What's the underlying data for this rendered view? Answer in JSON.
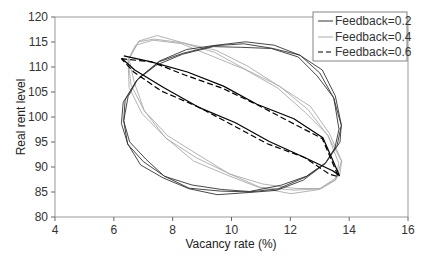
{
  "chart_data": {
    "type": "line",
    "title": "",
    "xlabel": "Vacancy rate (%)",
    "ylabel": "Real rent level",
    "xlim": [
      4,
      16
    ],
    "ylim": [
      80,
      120
    ],
    "xticks": [
      4,
      6,
      8,
      10,
      12,
      14,
      16
    ],
    "yticks": [
      80,
      85,
      90,
      95,
      100,
      105,
      110,
      115,
      120
    ],
    "grid": false,
    "legend_position": "upper right",
    "series": [
      {
        "name": "Feedback=0.2",
        "color": "#333333",
        "style": "solid",
        "shape": "closed loop (limit cycle)",
        "x": [
          13.7,
          13.5,
          13.0,
          12.3,
          11.4,
          10.4,
          9.4,
          8.4,
          7.5,
          6.8,
          6.4,
          6.3,
          6.5,
          7.0,
          7.7,
          8.6,
          9.6,
          10.6,
          11.6,
          12.5,
          13.2,
          13.6,
          13.7
        ],
        "y": [
          98.0,
          104.0,
          108.8,
          112.2,
          114.0,
          114.5,
          114.2,
          113.0,
          110.8,
          107.5,
          103.5,
          99.0,
          94.8,
          91.0,
          88.0,
          86.0,
          85.0,
          85.0,
          85.8,
          87.8,
          90.8,
          94.4,
          98.0
        ]
      },
      {
        "name": "Feedback=0.4",
        "color": "#aaaaaa",
        "style": "solid",
        "shape": "closed loop (limit cycle)",
        "x": [
          13.7,
          13.3,
          12.6,
          11.6,
          10.5,
          9.4,
          8.3,
          7.4,
          6.8,
          6.5,
          6.6,
          7.0,
          7.8,
          8.8,
          9.9,
          11.0,
          12.1,
          13.0,
          13.6,
          13.7
        ],
        "y": [
          91.0,
          96.5,
          101.5,
          106.0,
          109.8,
          112.8,
          114.8,
          115.8,
          114.8,
          111.5,
          106.5,
          101.0,
          96.0,
          91.8,
          88.5,
          86.2,
          85.2,
          85.6,
          87.8,
          91.0
        ]
      },
      {
        "name": "Feedback=0.6",
        "color": "#000000",
        "style": "dashed",
        "shape": "closed loop (limit cycle)",
        "x": [
          6.3,
          7.3,
          8.5,
          9.7,
          10.9,
          12.1,
          13.1,
          13.7,
          13.4,
          12.5,
          11.3,
          10.1,
          8.9,
          7.7,
          6.7,
          6.3
        ],
        "y": [
          112.0,
          111.2,
          109.0,
          106.0,
          102.8,
          99.5,
          95.8,
          88.5,
          89.0,
          92.0,
          95.2,
          98.6,
          102.2,
          105.8,
          109.2,
          112.0
        ]
      }
    ]
  },
  "legend": {
    "items": [
      {
        "label": "Feedback=0.2",
        "color": "#333333",
        "style": "solid"
      },
      {
        "label": "Feedback=0.4",
        "color": "#aaaaaa",
        "style": "solid"
      },
      {
        "label": "Feedback=0.6",
        "color": "#000000",
        "style": "dashed"
      }
    ]
  },
  "axes": {
    "x_title": "Vacancy rate (%)",
    "y_title": "Real rent level",
    "x_tick_labels": [
      "4",
      "6",
      "8",
      "10",
      "12",
      "14",
      "16"
    ],
    "y_tick_labels": [
      "80",
      "85",
      "90",
      "95",
      "100",
      "105",
      "110",
      "115",
      "120"
    ]
  }
}
